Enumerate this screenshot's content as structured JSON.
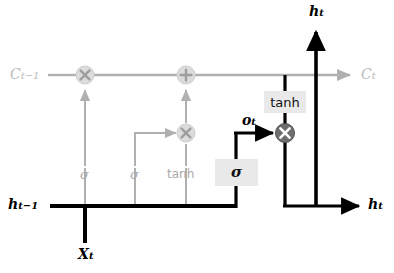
{
  "diagram": {
    "colors": {
      "line_black": "#000000",
      "line_gray": "#b0b0b0",
      "node_gray_fill": "#dcdcdc",
      "node_gray_stroke": "#c0c0c0",
      "node_dark_fill": "#6e6e6e",
      "node_dark_stroke": "#4a4a4a",
      "box_fill": "#e9e9e9",
      "label_gray": "#b9b9b9",
      "label_black": "#000000"
    },
    "labels": {
      "cell_state_in": "C",
      "cell_state_in_sub": "t−1",
      "cell_state_out": "C",
      "cell_state_out_sub": "t",
      "hidden_in": "h",
      "hidden_in_sub": "t−1",
      "hidden_out_top": "h",
      "hidden_out_top_sub": "t",
      "hidden_out_right": "h",
      "hidden_out_right_sub": "t",
      "input": "X",
      "input_sub": "t",
      "output_gate": "o",
      "output_gate_sub": "t"
    },
    "activations": {
      "forget_gate": "σ",
      "input_gate": "σ",
      "candidate": "tanh",
      "output_gate_sigma": "σ",
      "cell_tanh": "tanh"
    },
    "operators": {
      "forget_multiply": "✕",
      "add": "+",
      "input_multiply": "✕",
      "output_multiply": "✕"
    }
  }
}
